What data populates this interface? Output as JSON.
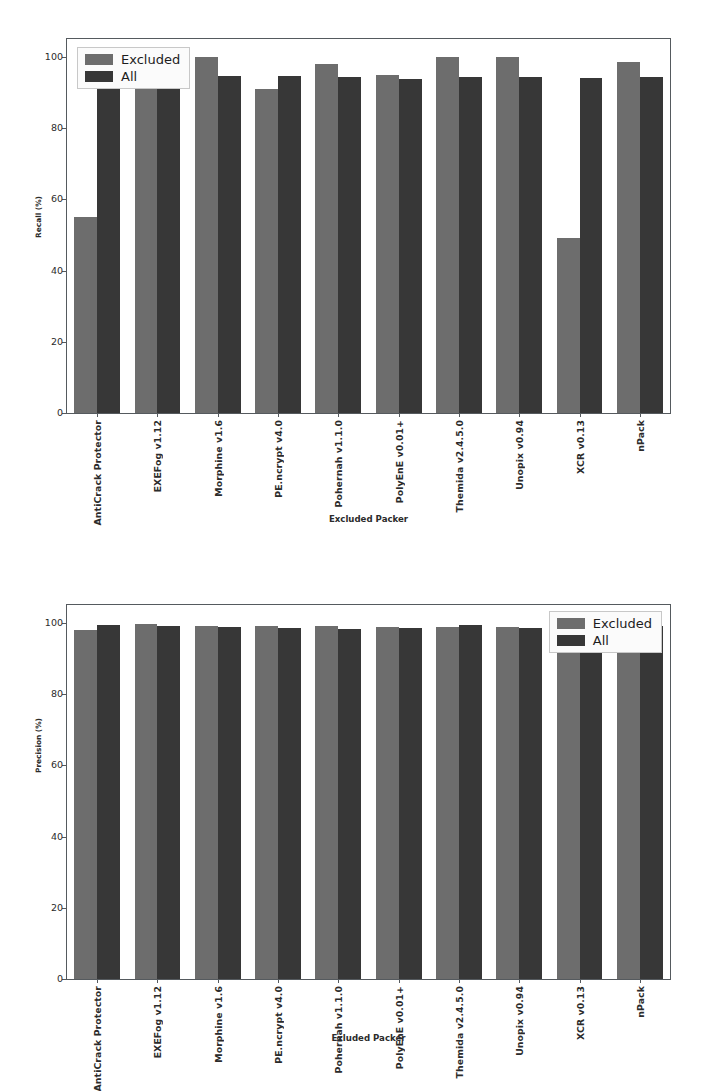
{
  "chart_data": [
    {
      "id": "recall",
      "type": "bar",
      "title": "",
      "xlabel": "Excluded Packer",
      "ylabel": "Recall (%)",
      "ylim": [
        0,
        105
      ],
      "yticks": [
        0,
        20,
        40,
        60,
        80,
        100
      ],
      "grid": false,
      "legend_position": "upper left",
      "categories": [
        "AntiCrack Protector",
        "EXEFog v1.12",
        "Morphine v1.6",
        "PE.ncrypt v4.0",
        "Pohernah v1.1.0",
        "PolyEnE v0.01+",
        "Themida v2.4.5.0",
        "Unopix v0.94",
        "XCR v0.13",
        "nPack"
      ],
      "series": [
        {
          "name": "Excluded",
          "color": "#6d6d6d",
          "values": [
            55.0,
            96.5,
            100.0,
            91.0,
            98.0,
            95.0,
            100.0,
            100.0,
            49.0,
            98.5
          ]
        },
        {
          "name": "All",
          "color": "#373737",
          "values": [
            94.0,
            94.5,
            94.5,
            94.5,
            94.3,
            93.8,
            94.3,
            94.3,
            94.0,
            94.3
          ]
        }
      ]
    },
    {
      "id": "precision",
      "type": "bar",
      "title": "",
      "xlabel": "Exluded Packer",
      "ylabel": "Precision (%)",
      "ylim": [
        0,
        105
      ],
      "yticks": [
        0,
        20,
        40,
        60,
        80,
        100
      ],
      "grid": false,
      "legend_position": "upper right",
      "categories": [
        "AntiCrack Protector",
        "EXEFog v1.12",
        "Morphine v1.6",
        "PE.ncrypt v4.0",
        "Pohernah v1.1.0",
        "PolyEnE v0.01+",
        "Themida v2.4.5.0",
        "Unopix v0.94",
        "XCR v0.13",
        "nPack"
      ],
      "series": [
        {
          "name": "Excluded",
          "color": "#6d6d6d",
          "values": [
            98.0,
            99.8,
            99.1,
            99.0,
            99.1,
            98.8,
            98.9,
            98.8,
            99.0,
            98.9
          ]
        },
        {
          "name": "All",
          "color": "#373737",
          "values": [
            99.4,
            99.2,
            98.9,
            98.5,
            98.3,
            98.6,
            99.3,
            98.6,
            99.1,
            99.1
          ]
        }
      ]
    }
  ],
  "legend": {
    "excluded_label": "Excluded",
    "all_label": "All"
  }
}
